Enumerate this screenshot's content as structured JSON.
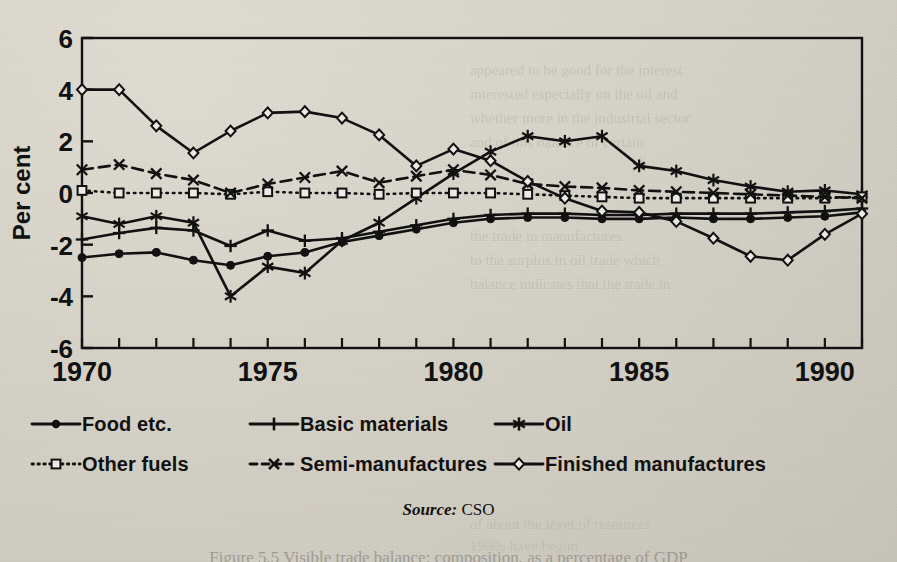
{
  "chart_data": {
    "type": "line",
    "title": "",
    "xlabel": "",
    "ylabel": "Per cent",
    "xlim": [
      1970,
      1991
    ],
    "ylim": [
      -6,
      6
    ],
    "yticks": [
      -6,
      -4,
      -2,
      0,
      2,
      4,
      6
    ],
    "ytick_labels": [
      "-6",
      "-4",
      "-2",
      "0",
      "2",
      "4",
      "6"
    ],
    "xticks": [
      1970,
      1971,
      1972,
      1973,
      1974,
      1975,
      1976,
      1977,
      1978,
      1979,
      1980,
      1981,
      1982,
      1983,
      1984,
      1985,
      1986,
      1987,
      1988,
      1989,
      1990,
      1991
    ],
    "xtick_labels_shown": [
      "1970",
      "1975",
      "1980",
      "1985",
      "1990"
    ],
    "grid": false,
    "legend_position": "below",
    "x": [
      1970,
      1971,
      1972,
      1973,
      1974,
      1975,
      1976,
      1977,
      1978,
      1979,
      1980,
      1981,
      1982,
      1983,
      1984,
      1985,
      1986,
      1987,
      1988,
      1989,
      1990,
      1991
    ],
    "series": [
      {
        "name": "Food etc.",
        "marker": "filled-circle",
        "linestyle": "solid",
        "values": [
          -2.5,
          -2.35,
          -2.3,
          -2.6,
          -2.8,
          -2.45,
          -2.3,
          -1.9,
          -1.65,
          -1.4,
          -1.15,
          -1.0,
          -0.95,
          -0.95,
          -1.0,
          -1.0,
          -0.95,
          -1.0,
          -1.0,
          -0.95,
          -0.9,
          -0.75
        ]
      },
      {
        "name": "Basic materials",
        "marker": "plus",
        "linestyle": "solid",
        "values": [
          -1.8,
          -1.55,
          -1.35,
          -1.45,
          -2.05,
          -1.45,
          -1.85,
          -1.75,
          -1.5,
          -1.25,
          -1.0,
          -0.85,
          -0.8,
          -0.8,
          -0.85,
          -0.85,
          -0.8,
          -0.8,
          -0.8,
          -0.75,
          -0.7,
          -0.6
        ]
      },
      {
        "name": "Oil",
        "marker": "asterisk",
        "linestyle": "solid",
        "values": [
          -0.9,
          -1.2,
          -0.9,
          -1.15,
          -4.0,
          -2.85,
          -3.1,
          -1.85,
          -1.15,
          -0.2,
          0.75,
          1.6,
          2.2,
          2.0,
          2.2,
          1.05,
          0.85,
          0.5,
          0.25,
          0.05,
          0.1,
          -0.05
        ]
      },
      {
        "name": "Other fuels",
        "marker": "open-square",
        "linestyle": "dotted",
        "values": [
          0.1,
          0.0,
          0.0,
          0.0,
          -0.05,
          0.05,
          0.0,
          0.0,
          -0.05,
          0.0,
          0.0,
          0.0,
          -0.05,
          -0.1,
          -0.15,
          -0.2,
          -0.2,
          -0.2,
          -0.2,
          -0.2,
          -0.2,
          -0.15
        ]
      },
      {
        "name": "Semi-manufactures",
        "marker": "x",
        "linestyle": "dashed",
        "values": [
          0.9,
          1.1,
          0.75,
          0.5,
          0.0,
          0.35,
          0.6,
          0.85,
          0.4,
          0.65,
          0.9,
          0.7,
          0.35,
          0.25,
          0.2,
          0.1,
          0.05,
          0.0,
          -0.05,
          -0.1,
          -0.15,
          -0.2
        ]
      },
      {
        "name": "Finished manufactures",
        "marker": "open-diamond",
        "linestyle": "solid",
        "values": [
          4.0,
          4.0,
          2.6,
          1.55,
          2.4,
          3.1,
          3.15,
          2.9,
          2.25,
          1.05,
          1.7,
          1.25,
          0.45,
          -0.2,
          -0.7,
          -0.75,
          -1.1,
          -1.75,
          -2.45,
          -2.6,
          -1.6,
          -0.8
        ]
      }
    ]
  },
  "axis": {
    "ylabel": "Per cent"
  },
  "legend": {
    "rows": [
      [
        {
          "label": "Food etc.",
          "glyph": "filled-circle-solid-line"
        },
        {
          "label": "Basic materials",
          "glyph": "plus-solid-line"
        },
        {
          "label": "Oil",
          "glyph": "asterisk-solid-line"
        }
      ],
      [
        {
          "label": "Other fuels",
          "glyph": "open-square-dotted-line"
        },
        {
          "label": "Semi-manufactures",
          "glyph": "x-dashed-line"
        },
        {
          "label": "Finished manufactures",
          "glyph": "open-diamond-solid-line"
        }
      ]
    ]
  },
  "source": {
    "prefix": "Source:",
    "value": "CSO"
  },
  "caption": {
    "text": "Figure 5.5 Visible trade balance: composition, as a percentage of GDP"
  },
  "ghost_text": [
    {
      "text": "appeared to be good for the interest",
      "x": 470,
      "y": 62,
      "size": 15,
      "rot": 0
    },
    {
      "text": "interested especially on the oil and",
      "x": 470,
      "y": 86,
      "size": 15,
      "rot": 0
    },
    {
      "text": "whether more in the industrial sector",
      "x": 470,
      "y": 110,
      "size": 15,
      "rot": 0
    },
    {
      "text": "and of this balance of certain",
      "x": 470,
      "y": 134,
      "size": 15,
      "rot": 0
    },
    {
      "text": "the trade in manufactures",
      "x": 470,
      "y": 228,
      "size": 15,
      "rot": 0
    },
    {
      "text": "to the surplus in oil trade which",
      "x": 470,
      "y": 252,
      "size": 15,
      "rot": 0
    },
    {
      "text": "balance indicates that the trade in",
      "x": 470,
      "y": 276,
      "size": 15,
      "rot": 0
    },
    {
      "text": "of about the level of resources",
      "x": 470,
      "y": 516,
      "size": 15,
      "rot": 0
    },
    {
      "text": "1980s have begun",
      "x": 470,
      "y": 538,
      "size": 15,
      "rot": 0
    }
  ],
  "colors": {
    "ink": "#111111",
    "paper": "#e9e7e2",
    "ghost": "#b9b5ad"
  }
}
